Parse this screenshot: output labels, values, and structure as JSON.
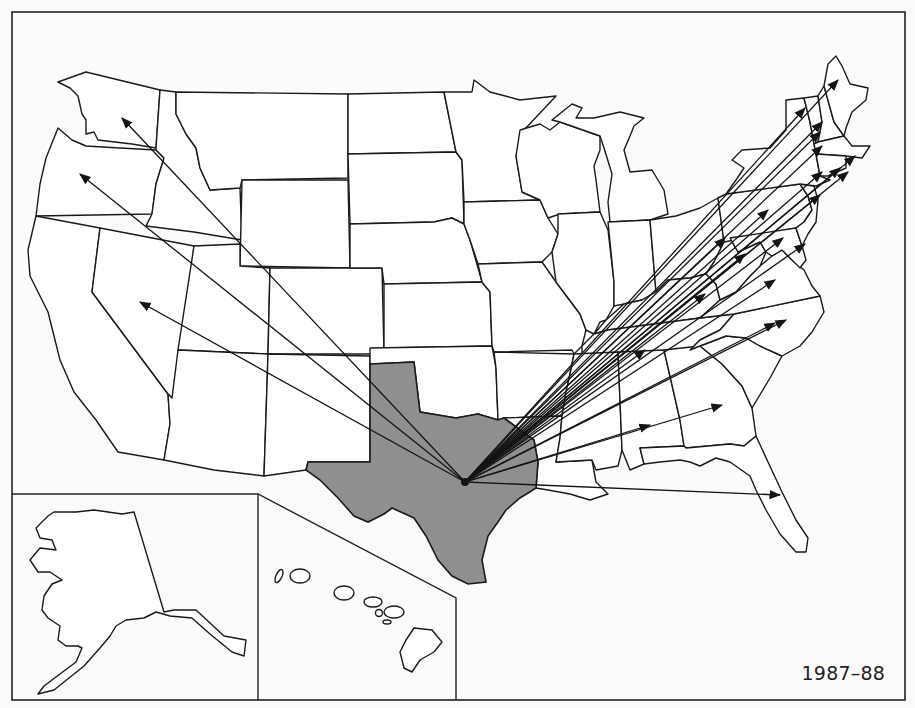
{
  "map": {
    "title": "",
    "period_label": "1987–88",
    "origin": {
      "state": "Texas",
      "x": 465,
      "y": 482
    },
    "colors": {
      "origin_fill": "#8f8f8f",
      "state_fill": "#ffffff",
      "line": "#141414",
      "background": "#fbfbfb"
    },
    "insets": [
      "Alaska",
      "Hawaii"
    ],
    "flows": [
      {
        "to": "Washington",
        "x": 122,
        "y": 118
      },
      {
        "to": "Oregon",
        "x": 80,
        "y": 174
      },
      {
        "to": "Nevada",
        "x": 140,
        "y": 302
      },
      {
        "to": "Maine",
        "x": 838,
        "y": 80
      },
      {
        "to": "New Hampshire",
        "x": 822,
        "y": 122
      },
      {
        "to": "Vermont",
        "x": 805,
        "y": 108
      },
      {
        "to": "Massachusetts",
        "x": 840,
        "y": 168
      },
      {
        "to": "Massachusetts (east)",
        "x": 855,
        "y": 156
      },
      {
        "to": "Rhode Island",
        "x": 848,
        "y": 172
      },
      {
        "to": "Connecticut",
        "x": 822,
        "y": 146
      },
      {
        "to": "Connecticut (south)",
        "x": 822,
        "y": 172
      },
      {
        "to": "New York",
        "x": 820,
        "y": 132
      },
      {
        "to": "New Jersey",
        "x": 820,
        "y": 195
      },
      {
        "to": "Pennsylvania",
        "x": 768,
        "y": 210
      },
      {
        "to": "Delaware",
        "x": 805,
        "y": 244
      },
      {
        "to": "Maryland",
        "x": 783,
        "y": 238
      },
      {
        "to": "Virginia",
        "x": 775,
        "y": 280
      },
      {
        "to": "North Carolina",
        "x": 775,
        "y": 323
      },
      {
        "to": "South Carolina",
        "x": 786,
        "y": 320
      },
      {
        "to": "Ohio",
        "x": 725,
        "y": 238
      },
      {
        "to": "West Virginia",
        "x": 745,
        "y": 254
      },
      {
        "to": "Kentucky",
        "x": 705,
        "y": 294
      },
      {
        "to": "Tennessee",
        "x": 645,
        "y": 350
      },
      {
        "to": "Georgia",
        "x": 722,
        "y": 405
      },
      {
        "to": "Florida",
        "x": 780,
        "y": 495
      },
      {
        "to": "Alabama",
        "x": 650,
        "y": 425
      }
    ]
  }
}
